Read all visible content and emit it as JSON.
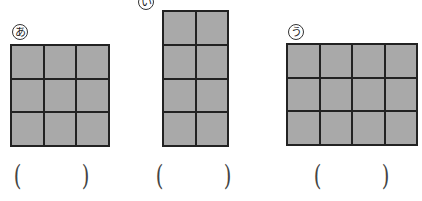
{
  "figures": [
    {
      "id": "a",
      "label": "あ",
      "cols": 3,
      "rows": 3,
      "answer": ""
    },
    {
      "id": "i",
      "label": "い",
      "cols": 2,
      "rows": 4,
      "answer": ""
    },
    {
      "id": "u",
      "label": "う",
      "cols": 4,
      "rows": 3,
      "answer": ""
    }
  ],
  "parens": {
    "open": "(",
    "close": ")"
  },
  "colors": {
    "fill": "#a9a9a9",
    "line": "#222222"
  }
}
